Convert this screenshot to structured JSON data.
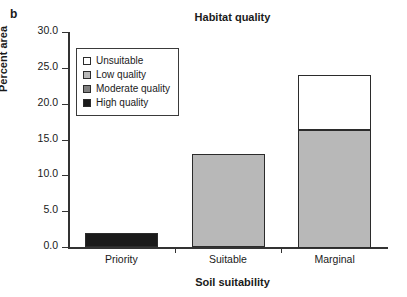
{
  "panel_label": "b",
  "chart_data": {
    "type": "bar",
    "subtype": "stacked-bar",
    "title": "Habitat quality",
    "xlabel": "Soil suitability",
    "ylabel": "Percent area",
    "categories": [
      "Priority",
      "Suitable",
      "Marginal"
    ],
    "ylim": [
      0.0,
      30.0
    ],
    "ytick_labels": [
      "0.0",
      "5.0",
      "10.0",
      "15.0",
      "20.0",
      "25.0",
      "30.0"
    ],
    "ytick_values": [
      0.0,
      5.0,
      10.0,
      15.0,
      20.0,
      25.0,
      30.0
    ],
    "grid": false,
    "legend_position": "upper-left-inside",
    "series": [
      {
        "name": "Unsuitable",
        "color": "#ffffff",
        "values": [
          0.0,
          0.0,
          7.7
        ]
      },
      {
        "name": "Low quality",
        "color": "#b8b8b8",
        "values": [
          0.0,
          13.0,
          16.5
        ]
      },
      {
        "name": "Moderate quality",
        "color": "#808080",
        "values": [
          0.0,
          0.0,
          0.0
        ]
      },
      {
        "name": "High quality",
        "color": "#1a1a1a",
        "values": [
          2.0,
          0.0,
          0.0
        ]
      }
    ],
    "totals": [
      2.0,
      13.0,
      24.2
    ]
  }
}
